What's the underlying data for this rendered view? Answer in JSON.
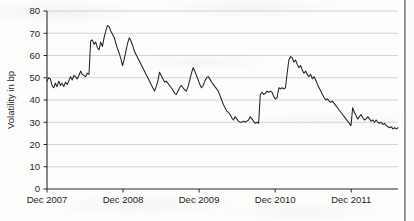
{
  "chart_data": {
    "type": "line",
    "title": "",
    "xlabel": "",
    "ylabel": "Volatility in bp",
    "ylim": [
      0,
      80
    ],
    "ytick_labels": [
      "0",
      "10",
      "20",
      "30",
      "40",
      "50",
      "60",
      "70",
      "80"
    ],
    "ytick_values": [
      0,
      10,
      20,
      30,
      40,
      50,
      60,
      70,
      80
    ],
    "xtick_labels": [
      "Dec 2007",
      "Dec 2008",
      "Dec 2009",
      "Dec 2010",
      "Dec 2011"
    ],
    "xtick_values": [
      0,
      52,
      104,
      156,
      208
    ],
    "xlim": [
      0,
      240
    ],
    "grid": "horizontal",
    "legend": "none",
    "line_color": "#242424",
    "series": [
      {
        "name": "Volatility",
        "values": [
          48.5,
          50.0,
          49.5,
          46.5,
          45.5,
          47.5,
          46.0,
          48.5,
          46.5,
          47.5,
          46.0,
          48.0,
          47.0,
          48.5,
          50.5,
          49.0,
          51.0,
          50.5,
          49.5,
          51.0,
          53.0,
          51.5,
          51.0,
          50.5,
          52.0,
          51.5,
          66.5,
          67.0,
          65.0,
          66.0,
          63.5,
          62.5,
          66.0,
          64.0,
          68.0,
          71.0,
          73.5,
          73.0,
          71.0,
          69.5,
          68.0,
          65.5,
          63.0,
          61.0,
          58.5,
          55.5,
          58.5,
          62.0,
          65.5,
          68.0,
          66.5,
          64.5,
          62.0,
          60.5,
          59.0,
          57.5,
          56.0,
          54.5,
          53.0,
          51.5,
          50.0,
          48.5,
          47.0,
          45.5,
          44.0,
          46.0,
          48.5,
          52.5,
          51.0,
          49.5,
          48.0,
          48.5,
          47.5,
          46.5,
          45.5,
          44.5,
          43.0,
          42.5,
          44.0,
          45.5,
          46.5,
          45.5,
          44.5,
          44.0,
          46.0,
          49.0,
          52.0,
          54.5,
          53.0,
          51.0,
          49.0,
          47.0,
          45.5,
          46.5,
          48.5,
          50.0,
          50.5,
          49.5,
          48.0,
          47.0,
          46.0,
          45.0,
          44.0,
          42.0,
          40.0,
          38.0,
          36.5,
          35.0,
          34.5,
          33.5,
          32.0,
          31.0,
          32.5,
          31.5,
          30.5,
          30.0,
          30.0,
          30.5,
          30.0,
          30.5,
          31.0,
          32.5,
          31.5,
          30.5,
          29.5,
          30.0,
          29.5,
          42.5,
          43.5,
          42.5,
          43.0,
          44.0,
          43.5,
          44.0,
          43.5,
          41.5,
          40.5,
          41.0,
          45.5,
          45.0,
          45.5,
          45.0,
          45.5,
          52.0,
          58.0,
          59.5,
          59.0,
          57.0,
          58.0,
          56.0,
          54.5,
          55.5,
          53.5,
          52.0,
          53.0,
          51.5,
          50.5,
          51.5,
          49.5,
          50.5,
          49.0,
          47.0,
          45.5,
          44.0,
          42.5,
          41.0,
          40.0,
          40.5,
          39.5,
          39.0,
          39.5,
          38.5,
          37.5,
          36.5,
          35.5,
          34.5,
          33.5,
          32.5,
          31.5,
          30.5,
          29.5,
          28.5,
          36.5,
          34.5,
          33.0,
          31.5,
          32.5,
          33.5,
          32.0,
          31.0,
          31.5,
          32.5,
          31.5,
          30.5,
          31.0,
          30.0,
          31.0,
          30.0,
          29.5,
          30.0,
          29.0,
          29.5,
          28.5,
          28.0,
          27.5,
          28.0,
          27.0,
          27.5,
          27.0,
          27.5
        ]
      }
    ]
  }
}
